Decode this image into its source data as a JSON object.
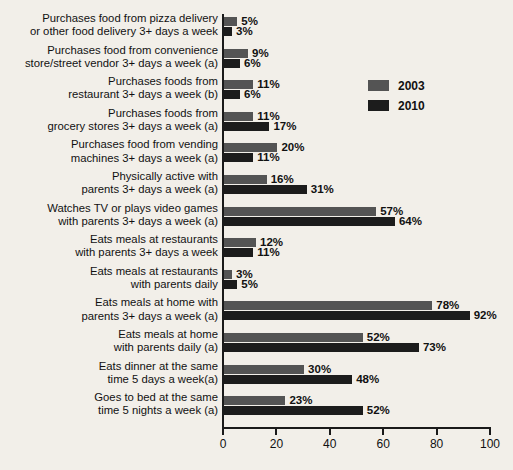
{
  "chart_data": {
    "type": "bar",
    "orientation": "horizontal",
    "title": "",
    "xlabel": "",
    "ylabel": "",
    "xlim": [
      0,
      100
    ],
    "xticks": [
      0,
      20,
      40,
      60,
      80,
      100
    ],
    "grid": false,
    "legend_position": "upper-right-inside",
    "value_suffix": "%",
    "categories": [
      "Purchases food from pizza delivery or other food delivery 3+ days a week",
      "Purchases food from convenience store/street vendor 3+ days a week (a)",
      "Purchases foods from restaurant 3+ days a week (b)",
      "Purchases foods from grocery stores 3+ days a week (a)",
      "Purchases food from vending machines 3+ days a week (a)",
      "Physically active with parents 3+ days a week (a)",
      "Watches TV or plays video games with parents 3+ days a week (a)",
      "Eats meals at restaurants with parents 3+ days a week",
      "Eats meals at restaurants with parents daily",
      "Eats meals at home with parents 3+ days a week (a)",
      "Eats meals at home with parents daily (a)",
      "Eats dinner at the same time 5 days a week(a)",
      "Goes to bed at the same time 5 nights a week (a)"
    ],
    "category_lines": [
      [
        "Purchases food from pizza delivery",
        "or other food delivery 3+ days a week"
      ],
      [
        "Purchases food from convenience",
        "store/street vendor 3+ days a week (a)"
      ],
      [
        "Purchases foods from",
        "restaurant 3+ days a week (b)"
      ],
      [
        "Purchases foods from",
        "grocery stores 3+ days a week (a)"
      ],
      [
        "Purchases food from vending",
        "machines 3+ days a week (a)"
      ],
      [
        "Physically active with",
        "parents 3+ days a week (a)"
      ],
      [
        "Watches TV or plays video games",
        "with parents 3+ days a week (a)"
      ],
      [
        "Eats meals at restaurants",
        "with parents 3+ days a week"
      ],
      [
        "Eats meals at restaurants",
        "with parents daily"
      ],
      [
        "Eats meals at home with",
        "parents 3+ days a week (a)"
      ],
      [
        "Eats meals at home",
        "with parents daily (a)"
      ],
      [
        "Eats dinner at the same",
        "time 5 days a week(a)"
      ],
      [
        "Goes to bed at the same",
        "time 5 nights a week (a)"
      ]
    ],
    "series": [
      {
        "name": "2003",
        "color": "#545454",
        "values": [
          5,
          9,
          11,
          11,
          20,
          16,
          57,
          12,
          3,
          78,
          52,
          30,
          23
        ],
        "labels": [
          "5%",
          "9%",
          "11%",
          "11%",
          "20%",
          "16%",
          "57%",
          "12%",
          "3%",
          "78%",
          "52%",
          "30%",
          "23%"
        ]
      },
      {
        "name": "2010",
        "color": "#1c1c1c",
        "values": [
          3,
          6,
          6,
          17,
          11,
          31,
          64,
          11,
          5,
          92,
          73,
          48,
          52
        ],
        "labels": [
          "3%",
          "6%",
          "6%",
          "17%",
          "11%",
          "31%",
          "64%",
          "11%",
          "5%",
          "92%",
          "73%",
          "48%",
          "52%"
        ]
      }
    ]
  },
  "legend": {
    "items": [
      {
        "label": "2003",
        "color": "#545454"
      },
      {
        "label": "2010",
        "color": "#1c1c1c"
      }
    ]
  },
  "axis": {
    "tick_labels": [
      "0",
      "20",
      "40",
      "60",
      "80",
      "100"
    ]
  }
}
